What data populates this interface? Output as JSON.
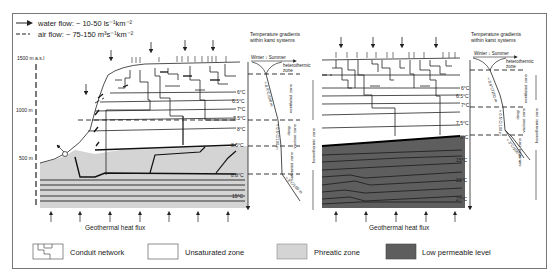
{
  "legend_top": {
    "water_flow": "water flow: ~ 10-50 ls⁻¹km⁻²",
    "air_flow": "air flow: ~ 75-150 m³s⁻¹km⁻²",
    "water_flow_icon": "solid-arrow-icon",
    "air_flow_icon": "dashed-line-icon"
  },
  "elevation_axis": {
    "ticks": [
      "1500 m a.s.l",
      "1000 m",
      "500 m"
    ]
  },
  "left_diagram": {
    "isotherms": [
      "6°C",
      "6.5°C",
      "7°C",
      "7.5°C",
      "8°C",
      "8.5°C",
      "8.8°C",
      "15°C"
    ],
    "bottom_label": "Geothermal heat flux"
  },
  "left_gradient": {
    "title_line1": "Temperature gradients",
    "title_line2": "within karst systems",
    "season": "Winter ↕ Summer",
    "zone_top": "heterothermic",
    "zone_top2": "zone",
    "grad1": "≈ 0.8°C/100 m",
    "grad2": "≈ 0.5°C/100 m",
    "grad3": "≈ 3°C/100 m",
    "ventilated": "ventilated zone",
    "deep": "deep",
    "vadose": "vadose zone",
    "saturated": "saturated zone",
    "homothermic": "homothermic zone"
  },
  "right_diagram": {
    "isotherms": [
      "6°C",
      "6.5°C",
      "7°C",
      "7.5°C",
      "8°C",
      "15°C",
      "21°C",
      "27°C"
    ],
    "bottom_label": "Geothermal heat flux"
  },
  "right_gradient": {
    "title_line1": "Temperature gradients",
    "title_line2": "within karst systems",
    "season": "Winter ↕ Summer",
    "zone_top": "heterothermic",
    "zone_top2": "zone",
    "grad1": "≈ 0.8°C/100 m",
    "grad2": "≈ 0.5°C/100 m",
    "grad3": "≈ 3°C/100 m",
    "ventilated": "ventilated zone",
    "deep": "deep",
    "vadose": "vadose zone",
    "saturated": "saturated zone",
    "homothermic": "homothermic zone"
  },
  "legend_bottom": [
    {
      "label": "Conduit network",
      "swatch": "conduit-pattern",
      "color": "#ffffff"
    },
    {
      "label": "Unsaturated zone",
      "swatch": "blank",
      "color": "#ffffff"
    },
    {
      "label": "Phreatic zone",
      "swatch": "fill",
      "color": "#d4d4d4"
    },
    {
      "label": "Low permeable level",
      "swatch": "fill",
      "color": "#5e5e5e"
    }
  ],
  "colors": {
    "phreatic": "#d4d4d4",
    "low_permeable": "#5e5e5e",
    "line": "#222222"
  }
}
